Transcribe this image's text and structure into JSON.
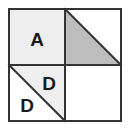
{
  "figure": {
    "canvas": {
      "width": 134,
      "height": 130,
      "background": "#ffffff"
    },
    "frame": {
      "name": "outer-square-border",
      "x": 9,
      "y": 9,
      "width": 112,
      "height": 112,
      "stroke": "#333333",
      "stroke_width": 2,
      "fill": "#ffffff"
    },
    "dividers": {
      "vertical_x": 65,
      "horizontal_y": 65,
      "stroke": "#333333",
      "stroke_width": 2
    },
    "colors": {
      "light_gray": "#eeeeee",
      "medium_gray": "#bdbdbd",
      "white": "#ffffff",
      "stroke": "#333333",
      "text": "#1a1a1a"
    },
    "quadrants": [
      {
        "id": "top-left",
        "shape": "square",
        "fill": "light_gray",
        "label": "A",
        "label_x": 37,
        "label_y": 39,
        "font_size": 19
      },
      {
        "id": "top-right",
        "shape": "diagonal-split",
        "diagonal": "top-left-to-bottom-right",
        "filled_half": "lower-left",
        "fill": "medium_gray",
        "label": "",
        "font_size": 19
      },
      {
        "id": "bottom-left",
        "shape": "diagonal-split",
        "diagonal": "top-left-to-bottom-right",
        "upper_right_fill": "light_gray",
        "upper_right_label": "D",
        "upper_right_label_x": 49,
        "upper_right_label_y": 83,
        "lower_left_fill": "white",
        "lower_left_label": "D",
        "lower_left_label_x": 27,
        "lower_left_label_y": 105,
        "font_size": 19
      },
      {
        "id": "bottom-right",
        "shape": "square",
        "fill": "white",
        "label": "",
        "font_size": 19
      }
    ],
    "labels": {
      "a_label": "A",
      "d_upper_label": "D",
      "d_lower_label": "D"
    }
  }
}
